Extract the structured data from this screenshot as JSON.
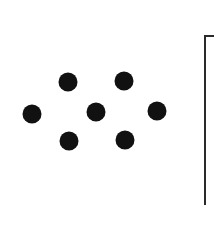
{
  "diagram": {
    "dot_color": "#111111",
    "frame_color": "#2a2a2a",
    "dots": [
      {
        "id": "left",
        "x": 32,
        "y": 114
      },
      {
        "id": "top-left",
        "x": 68,
        "y": 82
      },
      {
        "id": "bottom-left",
        "x": 69,
        "y": 141
      },
      {
        "id": "center",
        "x": 96,
        "y": 112
      },
      {
        "id": "top-right",
        "x": 124,
        "y": 81
      },
      {
        "id": "bottom-right",
        "x": 125,
        "y": 140
      },
      {
        "id": "right",
        "x": 157,
        "y": 111
      }
    ]
  }
}
